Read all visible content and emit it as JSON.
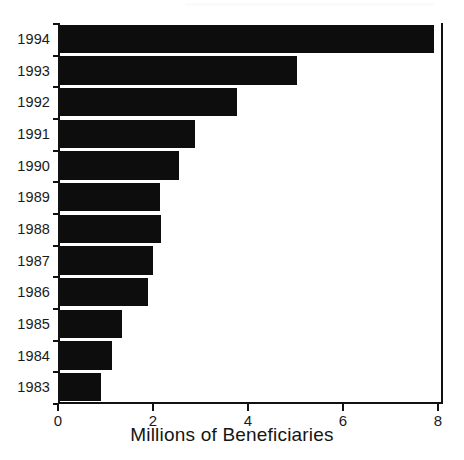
{
  "chart_data": {
    "type": "bar",
    "orientation": "horizontal",
    "title": "",
    "xlabel": "Millions of Beneficiaries",
    "ylabel": "",
    "categories": [
      "1994",
      "1993",
      "1992",
      "1991",
      "1990",
      "1989",
      "1988",
      "1987",
      "1986",
      "1985",
      "1984",
      "1983"
    ],
    "values": [
      7.87,
      4.99,
      3.73,
      2.84,
      2.5,
      2.1,
      2.13,
      1.96,
      1.85,
      1.3,
      1.1,
      0.87
    ],
    "series": [
      {
        "name": "Beneficiaries",
        "values": [
          7.87,
          4.99,
          3.73,
          2.84,
          2.5,
          2.1,
          2.13,
          1.96,
          1.85,
          1.3,
          1.1,
          0.87
        ]
      }
    ],
    "xlim": [
      0,
      8
    ],
    "xticks": [
      0,
      2,
      4,
      6,
      8
    ],
    "xtick_labels": [
      "0",
      "2",
      "4",
      "6",
      "8"
    ],
    "grid": false,
    "legend": false,
    "bar_color": "#0d0d0d",
    "axis_color": "#111111",
    "background_color": "#ffffff"
  },
  "axis": {
    "x_title": "Millions of Beneficiaries",
    "tick_0": "0",
    "tick_2": "2",
    "tick_4": "4",
    "tick_6": "6",
    "tick_8": "8"
  },
  "categories": {
    "c0": "1994",
    "c1": "1993",
    "c2": "1992",
    "c3": "1991",
    "c4": "1990",
    "c5": "1989",
    "c6": "1988",
    "c7": "1987",
    "c8": "1986",
    "c9": "1985",
    "c10": "1984",
    "c11": "1983"
  }
}
